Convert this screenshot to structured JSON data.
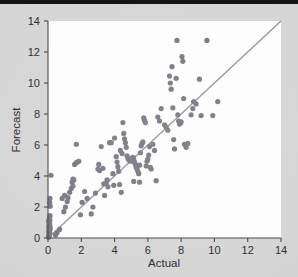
{
  "figure": {
    "background_color": "#d6d6d6",
    "plot_background_color": "#fdfdfd",
    "top_band_color": "#141414",
    "point_color": "#7b7b85",
    "reference_line_color": "#9a9a9a",
    "axis_color": "#4a4a4a"
  },
  "labels": {
    "x_title": "Actual",
    "y_title": "Forecast",
    "x_ticks": [
      "0",
      "2",
      "4",
      "6",
      "8",
      "10",
      "12",
      "14"
    ],
    "y_ticks": [
      "0",
      "2",
      "4",
      "6",
      "8",
      "10",
      "12",
      "14"
    ]
  },
  "chart_data": {
    "type": "scatter",
    "title": "",
    "xlabel": "Actual",
    "ylabel": "Forecast",
    "xlim": [
      0,
      14
    ],
    "ylim": [
      0,
      14
    ],
    "xticks": [
      0,
      2,
      4,
      6,
      8,
      10,
      12,
      14
    ],
    "yticks": [
      0,
      2,
      4,
      6,
      8,
      10,
      12,
      14
    ],
    "grid": false,
    "legend": null,
    "annotations": [],
    "reference_line": {
      "type": "identity",
      "description": "45-degree y = x reference line",
      "from": [
        0,
        0
      ],
      "to": [
        14,
        14
      ],
      "color": "#9a9a9a"
    },
    "marker": {
      "shape": "circle",
      "size_px": 3.4,
      "color": "#7b7b85"
    },
    "series": [
      {
        "name": "Forecast vs Actual",
        "points": [
          [
            0.05,
            0.05
          ],
          [
            0.07,
            0.12
          ],
          [
            0.06,
            0.22
          ],
          [
            0.09,
            0.3
          ],
          [
            0.05,
            0.4
          ],
          [
            0.08,
            0.5
          ],
          [
            0.1,
            0.58
          ],
          [
            0.06,
            0.66
          ],
          [
            0.12,
            0.75
          ],
          [
            0.07,
            0.85
          ],
          [
            0.09,
            0.95
          ],
          [
            0.05,
            1.05
          ],
          [
            0.11,
            1.15
          ],
          [
            0.08,
            1.25
          ],
          [
            0.06,
            0.18
          ],
          [
            0.1,
            0.35
          ],
          [
            0.12,
            0.62
          ],
          [
            0.07,
            0.78
          ],
          [
            0.09,
            1.0
          ],
          [
            0.05,
            0.45
          ],
          [
            0.13,
            2.05
          ],
          [
            0.1,
            2.3
          ],
          [
            0.12,
            2.55
          ],
          [
            0.18,
            4.05
          ],
          [
            0.45,
            0.2
          ],
          [
            0.55,
            0.35
          ],
          [
            0.7,
            0.55
          ],
          [
            0.95,
            1.7
          ],
          [
            1.05,
            2.0
          ],
          [
            1.15,
            2.35
          ],
          [
            1.2,
            2.6
          ],
          [
            1.3,
            2.95
          ],
          [
            1.4,
            3.2
          ],
          [
            1.5,
            3.35
          ],
          [
            0.85,
            2.55
          ],
          [
            1.0,
            2.75
          ],
          [
            1.55,
            3.75
          ],
          [
            1.6,
            4.75
          ],
          [
            1.7,
            4.85
          ],
          [
            1.75,
            4.9
          ],
          [
            1.85,
            4.95
          ],
          [
            1.7,
            6.05
          ],
          [
            1.5,
            3.8
          ],
          [
            1.45,
            3.6
          ],
          [
            1.95,
            1.5
          ],
          [
            2.05,
            2.3
          ],
          [
            2.2,
            3.0
          ],
          [
            2.35,
            2.55
          ],
          [
            2.6,
            1.55
          ],
          [
            2.7,
            2.0
          ],
          [
            2.85,
            2.9
          ],
          [
            3.0,
            4.45
          ],
          [
            3.05,
            4.75
          ],
          [
            3.1,
            4.35
          ],
          [
            3.2,
            5.9
          ],
          [
            3.3,
            4.5
          ],
          [
            3.35,
            3.5
          ],
          [
            3.4,
            2.75
          ],
          [
            3.5,
            3.55
          ],
          [
            3.55,
            3.75
          ],
          [
            3.6,
            3.3
          ],
          [
            3.7,
            6.15
          ],
          [
            3.8,
            6.15
          ],
          [
            3.9,
            4.15
          ],
          [
            3.95,
            3.4
          ],
          [
            4.0,
            6.45
          ],
          [
            4.1,
            5.25
          ],
          [
            4.15,
            4.9
          ],
          [
            4.2,
            4.6
          ],
          [
            4.25,
            4.3
          ],
          [
            4.3,
            3.45
          ],
          [
            4.4,
            2.95
          ],
          [
            4.5,
            7.45
          ],
          [
            4.55,
            6.75
          ],
          [
            4.6,
            6.4
          ],
          [
            4.65,
            6.15
          ],
          [
            4.7,
            5.85
          ],
          [
            4.75,
            5.3
          ],
          [
            4.8,
            5.15
          ],
          [
            4.85,
            5.05
          ],
          [
            4.9,
            5.0
          ],
          [
            4.95,
            4.95
          ],
          [
            5.0,
            5.05
          ],
          [
            5.05,
            5.15
          ],
          [
            5.1,
            5.2
          ],
          [
            5.15,
            5.1
          ],
          [
            5.2,
            4.9
          ],
          [
            5.25,
            4.75
          ],
          [
            5.3,
            4.55
          ],
          [
            5.35,
            4.45
          ],
          [
            5.4,
            4.3
          ],
          [
            5.45,
            4.15
          ],
          [
            5.5,
            4.7
          ],
          [
            5.55,
            5.5
          ],
          [
            5.6,
            5.95
          ],
          [
            5.65,
            6.1
          ],
          [
            5.7,
            6.2
          ],
          [
            5.75,
            7.75
          ],
          [
            5.8,
            7.6
          ],
          [
            5.85,
            7.45
          ],
          [
            4.35,
            5.65
          ],
          [
            4.45,
            5.45
          ],
          [
            5.15,
            3.65
          ],
          [
            5.5,
            3.6
          ],
          [
            5.9,
            4.65
          ],
          [
            5.95,
            4.95
          ],
          [
            6.0,
            5.1
          ],
          [
            6.05,
            5.35
          ],
          [
            6.1,
            5.9
          ],
          [
            6.15,
            4.55
          ],
          [
            6.2,
            4.45
          ],
          [
            6.3,
            6.05
          ],
          [
            6.4,
            5.65
          ],
          [
            6.5,
            3.7
          ],
          [
            6.6,
            7.8
          ],
          [
            6.7,
            7.55
          ],
          [
            6.8,
            8.35
          ],
          [
            7.0,
            7.3
          ],
          [
            7.1,
            7.15
          ],
          [
            7.2,
            6.95
          ],
          [
            7.3,
            10.45
          ],
          [
            7.35,
            10.0
          ],
          [
            7.4,
            9.6
          ],
          [
            7.45,
            11.05
          ],
          [
            7.5,
            8.4
          ],
          [
            7.55,
            6.35
          ],
          [
            7.6,
            5.75
          ],
          [
            7.7,
            10.3
          ],
          [
            7.75,
            12.75
          ],
          [
            7.8,
            7.95
          ],
          [
            7.85,
            7.55
          ],
          [
            7.9,
            7.35
          ],
          [
            7.95,
            7.4
          ],
          [
            8.0,
            7.5
          ],
          [
            8.05,
            11.7
          ],
          [
            8.1,
            11.4
          ],
          [
            8.15,
            9.0
          ],
          [
            8.2,
            6.05
          ],
          [
            8.3,
            5.85
          ],
          [
            8.4,
            6.1
          ],
          [
            8.6,
            7.95
          ],
          [
            8.7,
            8.35
          ],
          [
            8.75,
            8.8
          ],
          [
            8.9,
            8.65
          ],
          [
            9.1,
            10.25
          ],
          [
            9.2,
            7.9
          ],
          [
            9.55,
            12.75
          ],
          [
            9.9,
            7.9
          ],
          [
            10.2,
            8.8
          ],
          [
            0.06,
            0.08
          ],
          [
            0.08,
            0.28
          ],
          [
            0.11,
            0.52
          ],
          [
            0.07,
            0.7
          ],
          [
            0.09,
            0.88
          ],
          [
            0.05,
            1.1
          ],
          [
            0.1,
            1.35
          ],
          [
            0.12,
            1.45
          ]
        ]
      }
    ]
  }
}
